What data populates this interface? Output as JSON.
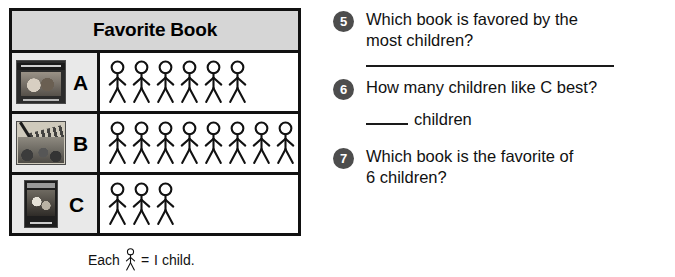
{
  "graph": {
    "title": "Favorite Book",
    "symbol_name": "stick-figure",
    "rows": [
      {
        "letter": "A",
        "count": 6,
        "cover": "cover-a",
        "cover_name": "book-cover-a"
      },
      {
        "letter": "B",
        "count": 8,
        "cover": "cover-b",
        "cover_name": "book-cover-b"
      },
      {
        "letter": "C",
        "count": 3,
        "cover": "cover-c",
        "cover_name": "book-cover-c"
      }
    ],
    "legend": {
      "prefix": "Each",
      "equals": "=",
      "value": "I child."
    }
  },
  "questions": [
    {
      "number": "5",
      "line1": "Which book is favored by the",
      "line2": "most children?",
      "answer_type": "long-line"
    },
    {
      "number": "6",
      "line1": "How many children like C best?",
      "line2": "",
      "answer_type": "short-blank",
      "answer_suffix": "children"
    },
    {
      "number": "7",
      "line1": "Which book is the favorite of",
      "line2": "6 children?",
      "answer_type": "none"
    }
  ],
  "chart_data": {
    "type": "pictograph",
    "title": "Favorite Book",
    "categories": [
      "A",
      "B",
      "C"
    ],
    "values": [
      6,
      8,
      3
    ],
    "symbol_value": 1,
    "symbol_label": "Each stick figure = 1 child.",
    "xlabel": "",
    "ylabel": "Book",
    "grid": false,
    "legend_position": "below"
  },
  "colors": {
    "header_fill": "#d6d6d6",
    "cell_fill": "#e9e9e9",
    "border": "#111111",
    "badge": "#4d4d4d",
    "text": "#111111"
  }
}
